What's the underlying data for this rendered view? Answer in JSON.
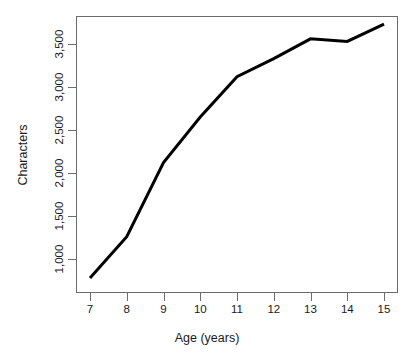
{
  "chart_data": {
    "type": "line",
    "title": "",
    "xlabel": "Age (years)",
    "ylabel": "Characters",
    "x": [
      7,
      8,
      9,
      10,
      11,
      12,
      13,
      14,
      15
    ],
    "values": [
      780,
      1260,
      2120,
      2650,
      3120,
      3330,
      3560,
      3530,
      3730
    ],
    "series": [
      {
        "name": "Characters",
        "values": [
          780,
          1260,
          2120,
          2650,
          3120,
          3330,
          3560,
          3530,
          3730
        ]
      }
    ],
    "x_tick_labels": [
      "7",
      "8",
      "9",
      "10",
      "11",
      "12",
      "13",
      "14",
      "15"
    ],
    "y_tick_labels": [
      "1,000",
      "1,500",
      "2,000",
      "2,500",
      "3,000",
      "3,500"
    ],
    "y_tick_values": [
      1000,
      1500,
      2000,
      2500,
      3000,
      3500
    ],
    "xlim": [
      7,
      15
    ],
    "ylim": [
      700,
      3800
    ],
    "grid": false,
    "legend": "none",
    "line_color": "#000000",
    "line_width": 3,
    "frame_color": "#6b6b6b",
    "background": "#ffffff"
  }
}
